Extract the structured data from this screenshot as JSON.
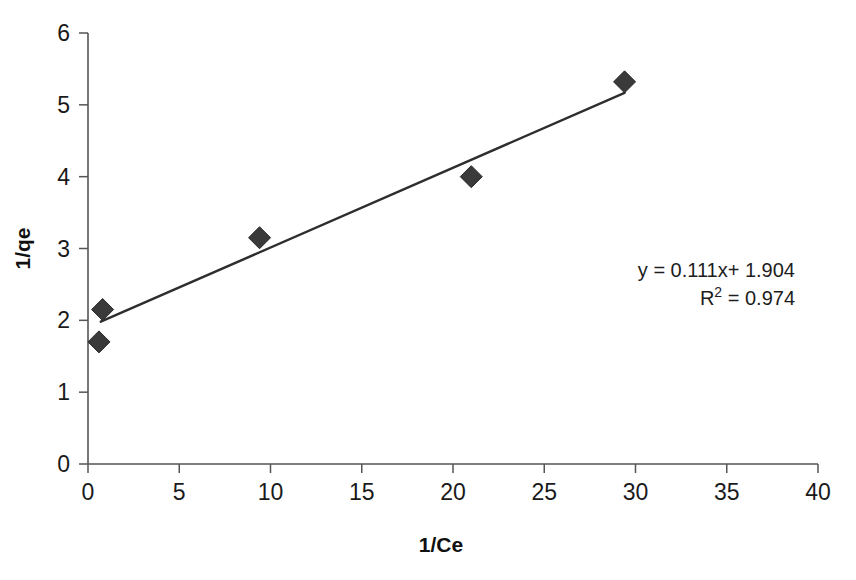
{
  "chart_data": {
    "type": "scatter",
    "title": "",
    "xlabel": "1/Ce",
    "ylabel": "1/qe",
    "xlim": [
      0,
      40
    ],
    "ylim": [
      0,
      6
    ],
    "xticks": [
      "0",
      "5",
      "10",
      "15",
      "20",
      "25",
      "30",
      "35",
      "40"
    ],
    "yticks": [
      "0",
      "1",
      "2",
      "3",
      "4",
      "5",
      "6"
    ],
    "grid": false,
    "legend": "none",
    "series": [
      {
        "name": "data",
        "marker": "diamond",
        "color": "#3a3a3a",
        "points": [
          {
            "x": 0.6,
            "y": 1.7
          },
          {
            "x": 0.8,
            "y": 2.15
          },
          {
            "x": 9.4,
            "y": 3.15
          },
          {
            "x": 21.0,
            "y": 4.0
          },
          {
            "x": 29.4,
            "y": 5.32
          }
        ]
      }
    ],
    "trendline": {
      "name": "linear fit",
      "slope": 0.111,
      "intercept": 1.904,
      "x_start": 0.7,
      "x_end": 29.4,
      "color": "#2e2e2e"
    },
    "annotations": {
      "equation": "y = 0.111x+ 1.904",
      "r_squared_label": "R",
      "r_squared_exponent": "2",
      "r_squared_value": "= 0.974"
    }
  },
  "colors": {
    "marker": "#3a3a3a",
    "trendline": "#2e2e2e",
    "axis": "#555555",
    "text": "#1a1a1a",
    "background": "#ffffff"
  }
}
